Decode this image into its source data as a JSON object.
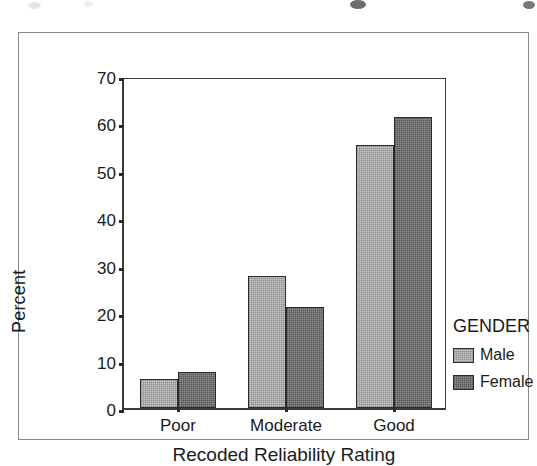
{
  "chart_data": {
    "type": "bar",
    "title": "",
    "categories": [
      "Poor",
      "Moderate",
      "Good"
    ],
    "series": [
      {
        "name": "Male",
        "values": [
          6.2,
          27.8,
          55.4
        ],
        "color": "#b5b5b5"
      },
      {
        "name": "Female",
        "values": [
          7.5,
          21.4,
          61.4
        ],
        "color": "#6e6e6e"
      }
    ],
    "xlabel": "Recoded Reliability Rating",
    "ylabel": "Percent",
    "ylim": [
      0,
      70
    ],
    "yticks": [
      0,
      10,
      20,
      30,
      40,
      50,
      60,
      70
    ],
    "ytick_labels": [
      "0",
      "10",
      "20",
      "30",
      "40",
      "50",
      "60",
      "70"
    ],
    "grid": false,
    "legend": {
      "title": "GENDER",
      "position": "right",
      "entries": [
        "Male",
        "Female"
      ]
    }
  },
  "legend": {
    "title": "GENDER",
    "items": [
      {
        "label": "Male",
        "color": "#b5b5b5"
      },
      {
        "label": "Female",
        "color": "#6e6e6e"
      }
    ]
  },
  "axes": {
    "y_title": "Percent",
    "x_title": "Recoded Reliability Rating"
  }
}
